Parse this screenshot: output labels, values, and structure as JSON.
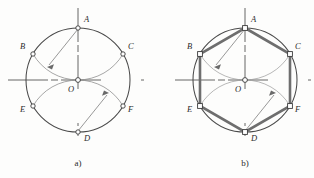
{
  "figure": {
    "title": "",
    "panels": [
      {
        "id": "a",
        "caption": "a)",
        "caption_x": 78,
        "caption_y": 166,
        "center": {
          "x": 78,
          "y": 80,
          "label": "O"
        },
        "radius": 52,
        "vertex_marker": "circle",
        "hexagon_drawn": false,
        "points": [
          {
            "label": "A",
            "x": 78,
            "y": 28,
            "lx": 84,
            "ly": 22
          },
          {
            "label": "B",
            "x": 33,
            "y": 54,
            "lx": 20,
            "ly": 49
          },
          {
            "label": "C",
            "x": 123,
            "y": 54,
            "lx": 128,
            "ly": 49
          },
          {
            "label": "E",
            "x": 33,
            "y": 106,
            "lx": 20,
            "ly": 112
          },
          {
            "label": "F",
            "x": 123,
            "y": 106,
            "lx": 128,
            "ly": 112
          },
          {
            "label": "D",
            "x": 78,
            "y": 132,
            "lx": 84,
            "ly": 141
          }
        ],
        "construction_arcs": [
          {
            "from": "B",
            "to": "C",
            "center": "A",
            "note": "arc radius R centred at A through B, O, C"
          },
          {
            "from": "E",
            "to": "F",
            "center": "D",
            "note": "arc radius R centred at D through E, O, F"
          }
        ],
        "radius_arrows": [
          {
            "from": "A",
            "to_x": 47,
            "to_y": 67,
            "note": "radius pointer from A"
          },
          {
            "from": "D",
            "to_x": 109,
            "to_y": 93,
            "note": "radius pointer from D"
          }
        ]
      },
      {
        "id": "b",
        "caption": "b)",
        "caption_x": 245,
        "caption_y": 166,
        "center": {
          "x": 245,
          "y": 80,
          "label": "O"
        },
        "radius": 52,
        "vertex_marker": "square",
        "hexagon_drawn": true,
        "points": [
          {
            "label": "A",
            "x": 245,
            "y": 28,
            "lx": 251,
            "ly": 22
          },
          {
            "label": "B",
            "x": 200,
            "y": 54,
            "lx": 187,
            "ly": 49
          },
          {
            "label": "C",
            "x": 290,
            "y": 54,
            "lx": 295,
            "ly": 49
          },
          {
            "label": "E",
            "x": 200,
            "y": 106,
            "lx": 187,
            "ly": 112
          },
          {
            "label": "F",
            "x": 290,
            "y": 106,
            "lx": 295,
            "ly": 112
          },
          {
            "label": "D",
            "x": 245,
            "y": 132,
            "lx": 251,
            "ly": 141
          }
        ],
        "construction_arcs": [
          {
            "from": "B",
            "to": "C",
            "center": "A",
            "note": "arc radius R centred at A through B, O, C"
          },
          {
            "from": "E",
            "to": "F",
            "center": "D",
            "note": "arc radius R centred at D through E, O, F"
          }
        ],
        "radius_arrows": [
          {
            "from": "A",
            "to_x": 214,
            "to_y": 67,
            "note": "radius pointer from A"
          },
          {
            "from": "D",
            "to_x": 276,
            "to_y": 93,
            "note": "radius pointer from D"
          }
        ]
      }
    ],
    "colors": {
      "circle_stroke": "#4a4a4a",
      "arc_stroke": "#8a8a8a",
      "axis_stroke": "#555555",
      "hexagon_stroke": "#6e6e6e",
      "marker_stroke": "#3a3a3a",
      "marker_fill": "#ffffff",
      "label_text": "#2b2b2b",
      "background": "#fdfdfc"
    }
  }
}
